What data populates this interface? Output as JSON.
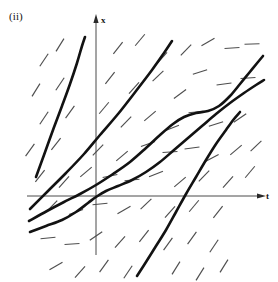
{
  "figure": {
    "panel_label": "(ii)",
    "kind": "direction-field-with-solution-curves",
    "background_color": "#ffffff",
    "curve_color": "#121212",
    "tick_color": "#4e4e4e",
    "axis_color": "#4a4a4a"
  },
  "axes": {
    "vertical": {
      "name": "x",
      "x_pixel": 96,
      "y_top": 18,
      "y_bottom": 255,
      "arrow": "up",
      "label_x": 101,
      "label_y": 23
    },
    "horizontal": {
      "name": "t",
      "y_pixel": 196,
      "x_left": 27,
      "x_right": 262,
      "arrow": "right",
      "label_x": 266,
      "label_y": 199
    },
    "origin": {
      "x": 96,
      "y": 196
    }
  },
  "chart_data": {
    "type": "line",
    "title": "",
    "xlabel": "t",
    "ylabel": "x",
    "grid": false,
    "legend": "none",
    "solution_curves": [
      {
        "name": "steep-left-curve",
        "points": [
          [
            36,
            177
          ],
          [
            44,
            155
          ],
          [
            53,
            130
          ],
          [
            62,
            106
          ],
          [
            70,
            84
          ],
          [
            77,
            63
          ],
          [
            82,
            46
          ],
          [
            85,
            37
          ]
        ]
      },
      {
        "name": "lower-left-rising-line",
        "points": [
          [
            30,
            209
          ],
          [
            48,
            191
          ],
          [
            66,
            173
          ],
          [
            84,
            154
          ],
          [
            100,
            135
          ],
          [
            118,
            114
          ],
          [
            136,
            91
          ],
          [
            152,
            70
          ],
          [
            164,
            53
          ],
          [
            172,
            41
          ]
        ]
      },
      {
        "name": "s-shaped-curve",
        "points": [
          [
            29,
            221
          ],
          [
            47,
            211
          ],
          [
            64,
            202
          ],
          [
            80,
            194
          ],
          [
            96,
            185
          ],
          [
            113,
            174
          ],
          [
            130,
            162
          ],
          [
            146,
            148
          ],
          [
            160,
            135
          ],
          [
            173,
            124
          ],
          [
            184,
            117
          ],
          [
            196,
            113
          ],
          [
            208,
            111
          ],
          [
            219,
            106
          ],
          [
            230,
            96
          ],
          [
            240,
            84
          ],
          [
            249,
            73
          ],
          [
            258,
            62
          ],
          [
            263,
            56
          ]
        ]
      },
      {
        "name": "sigmoid-through-origin",
        "points": [
          [
            30,
            232
          ],
          [
            46,
            226
          ],
          [
            62,
            220
          ],
          [
            76,
            212
          ],
          [
            88,
            203
          ],
          [
            96,
            197
          ],
          [
            106,
            191
          ],
          [
            118,
            186
          ],
          [
            132,
            180
          ],
          [
            146,
            172
          ],
          [
            160,
            162
          ],
          [
            174,
            150
          ],
          [
            188,
            138
          ],
          [
            202,
            126
          ],
          [
            216,
            114
          ],
          [
            230,
            103
          ],
          [
            244,
            93
          ],
          [
            256,
            85
          ],
          [
            264,
            80
          ]
        ]
      },
      {
        "name": "steep-lower-right-curve",
        "points": [
          [
            137,
            276
          ],
          [
            146,
            262
          ],
          [
            156,
            246
          ],
          [
            166,
            230
          ],
          [
            176,
            212
          ],
          [
            186,
            194
          ],
          [
            196,
            177
          ],
          [
            206,
            160
          ],
          [
            216,
            144
          ],
          [
            226,
            130
          ],
          [
            234,
            119
          ],
          [
            240,
            112
          ]
        ]
      }
    ],
    "field_ticks": [
      {
        "x": 44,
        "y": 60,
        "angle": -56
      },
      {
        "x": 60,
        "y": 45,
        "angle": -58
      },
      {
        "x": 118,
        "y": 48,
        "angle": -52
      },
      {
        "x": 140,
        "y": 40,
        "angle": -50
      },
      {
        "x": 162,
        "y": 58,
        "angle": -48
      },
      {
        "x": 186,
        "y": 50,
        "angle": -46
      },
      {
        "x": 208,
        "y": 42,
        "angle": -30
      },
      {
        "x": 232,
        "y": 48,
        "angle": -4
      },
      {
        "x": 252,
        "y": 44,
        "angle": -2
      },
      {
        "x": 36,
        "y": 90,
        "angle": -58
      },
      {
        "x": 60,
        "y": 84,
        "angle": -56
      },
      {
        "x": 110,
        "y": 78,
        "angle": -52
      },
      {
        "x": 134,
        "y": 88,
        "angle": -48
      },
      {
        "x": 158,
        "y": 76,
        "angle": -44
      },
      {
        "x": 180,
        "y": 94,
        "angle": -36
      },
      {
        "x": 200,
        "y": 72,
        "angle": -18
      },
      {
        "x": 224,
        "y": 84,
        "angle": -8
      },
      {
        "x": 248,
        "y": 78,
        "angle": -4
      },
      {
        "x": 44,
        "y": 118,
        "angle": -56
      },
      {
        "x": 70,
        "y": 112,
        "angle": -54
      },
      {
        "x": 104,
        "y": 108,
        "angle": -50
      },
      {
        "x": 126,
        "y": 122,
        "angle": -46
      },
      {
        "x": 150,
        "y": 116,
        "angle": -40
      },
      {
        "x": 172,
        "y": 128,
        "angle": -22
      },
      {
        "x": 196,
        "y": 112,
        "angle": -6
      },
      {
        "x": 216,
        "y": 124,
        "angle": -18
      },
      {
        "x": 240,
        "y": 118,
        "angle": -34
      },
      {
        "x": 30,
        "y": 150,
        "angle": -54
      },
      {
        "x": 56,
        "y": 144,
        "angle": -52
      },
      {
        "x": 98,
        "y": 150,
        "angle": -46
      },
      {
        "x": 122,
        "y": 156,
        "angle": -40
      },
      {
        "x": 148,
        "y": 144,
        "angle": -20
      },
      {
        "x": 170,
        "y": 152,
        "angle": -4
      },
      {
        "x": 192,
        "y": 148,
        "angle": -8
      },
      {
        "x": 212,
        "y": 158,
        "angle": -28
      },
      {
        "x": 236,
        "y": 150,
        "angle": -40
      },
      {
        "x": 256,
        "y": 146,
        "angle": -44
      },
      {
        "x": 40,
        "y": 176,
        "angle": -52
      },
      {
        "x": 64,
        "y": 182,
        "angle": -48
      },
      {
        "x": 86,
        "y": 172,
        "angle": -40
      },
      {
        "x": 110,
        "y": 176,
        "angle": -12
      },
      {
        "x": 132,
        "y": 180,
        "angle": -6
      },
      {
        "x": 156,
        "y": 174,
        "angle": -22
      },
      {
        "x": 180,
        "y": 182,
        "angle": -40
      },
      {
        "x": 204,
        "y": 176,
        "angle": -46
      },
      {
        "x": 228,
        "y": 182,
        "angle": -48
      },
      {
        "x": 250,
        "y": 172,
        "angle": -50
      },
      {
        "x": 52,
        "y": 206,
        "angle": -46
      },
      {
        "x": 76,
        "y": 212,
        "angle": -20
      },
      {
        "x": 100,
        "y": 204,
        "angle": -6
      },
      {
        "x": 124,
        "y": 210,
        "angle": -30
      },
      {
        "x": 146,
        "y": 204,
        "angle": -44
      },
      {
        "x": 170,
        "y": 212,
        "angle": -48
      },
      {
        "x": 194,
        "y": 206,
        "angle": -50
      },
      {
        "x": 218,
        "y": 212,
        "angle": -52
      },
      {
        "x": 48,
        "y": 238,
        "angle": -6
      },
      {
        "x": 72,
        "y": 244,
        "angle": -4
      },
      {
        "x": 96,
        "y": 236,
        "angle": -34
      },
      {
        "x": 120,
        "y": 242,
        "angle": -48
      },
      {
        "x": 144,
        "y": 236,
        "angle": -52
      },
      {
        "x": 168,
        "y": 244,
        "angle": -54
      },
      {
        "x": 192,
        "y": 238,
        "angle": -54
      },
      {
        "x": 214,
        "y": 246,
        "angle": -56
      },
      {
        "x": 56,
        "y": 266,
        "angle": -30
      },
      {
        "x": 80,
        "y": 272,
        "angle": -48
      },
      {
        "x": 104,
        "y": 266,
        "angle": -54
      },
      {
        "x": 128,
        "y": 272,
        "angle": -56
      },
      {
        "x": 176,
        "y": 268,
        "angle": -58
      },
      {
        "x": 200,
        "y": 274,
        "angle": -58
      },
      {
        "x": 224,
        "y": 266,
        "angle": -58
      }
    ],
    "tick_length": 15
  }
}
